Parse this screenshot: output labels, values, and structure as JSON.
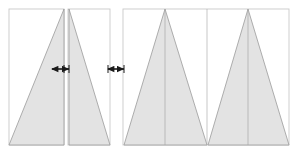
{
  "figure": {
    "type": "geometric-diagram",
    "canvas": {
      "width": 297,
      "height": 153
    },
    "background_color": "#ffffff"
  },
  "style": {
    "shape_fill": "#e3e3e3",
    "shape_stroke": "#9a9a9a",
    "frame_stroke": "#c9c9c9",
    "divider_stroke": "#b0b0b0",
    "center_line_stroke": "#a8a8a8",
    "arrow_color": "#1a1a1a",
    "shape_stroke_width": 0.8,
    "frame_stroke_width": 0.9,
    "divider_stroke_width": 0.7,
    "center_line_stroke_width": 0.7,
    "arrow_stroke_width": 1.6
  },
  "panels": [
    {
      "id": "panel-left-ramp-up",
      "label": "left-ramp-up-panel",
      "frame": {
        "x": 9,
        "y": 9,
        "width": 55,
        "height": 136
      },
      "shapes": [
        {
          "id": "triangle-ramp-up",
          "name": "triangle-right-apex",
          "points": "9,145 64,145 64,9"
        }
      ],
      "center_lines": []
    },
    {
      "id": "panel-mid-ramp-down",
      "label": "mid-ramp-down-panel",
      "frame": {
        "x": 68,
        "y": 9,
        "width": 42,
        "height": 136
      },
      "shapes": [
        {
          "id": "triangle-ramp-down",
          "name": "triangle-left-apex",
          "points": "69,9 110,145 69,145"
        }
      ],
      "center_lines": []
    },
    {
      "id": "panel-right-double-peak",
      "label": "right-double-peak-panel",
      "frame": {
        "x": 123,
        "y": 9,
        "width": 166,
        "height": 136
      },
      "shapes": [
        {
          "id": "triangle-peak-1",
          "name": "triangle-peak-left",
          "points": "124,145 165,9 207,145"
        },
        {
          "id": "triangle-peak-2",
          "name": "triangle-peak-right",
          "points": "208,145 248,9 289,145"
        }
      ],
      "center_lines": [
        {
          "id": "center-line-peak-1",
          "x": 165,
          "y1": 9,
          "y2": 145
        },
        {
          "id": "center-line-peak-2",
          "x": 248,
          "y1": 9,
          "y2": 145
        }
      ],
      "dividers": [
        {
          "id": "divider-mid",
          "x": 207,
          "y1": 9,
          "y2": 145
        }
      ]
    }
  ],
  "arrows": [
    {
      "id": "arrow-gap-1",
      "name": "double-headed-arrow-gap-1",
      "y": 69,
      "x1": 52,
      "x2": 69,
      "label": ""
    },
    {
      "id": "arrow-gap-2",
      "name": "double-headed-arrow-gap-2",
      "y": 69,
      "x1": 108,
      "x2": 124,
      "label": ""
    }
  ],
  "tick_marks": [
    {
      "id": "tick-left-1",
      "x": 64,
      "y1": 65,
      "y2": 73
    },
    {
      "id": "tick-left-2",
      "x": 69,
      "y1": 65,
      "y2": 73
    },
    {
      "id": "tick-right-1",
      "x": 108,
      "y1": 65,
      "y2": 73
    },
    {
      "id": "tick-right-2",
      "x": 124,
      "y1": 65,
      "y2": 73
    }
  ]
}
